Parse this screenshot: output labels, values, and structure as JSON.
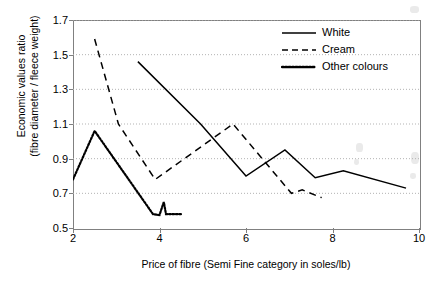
{
  "chart_data": {
    "type": "line",
    "title": "",
    "subtitle": "",
    "xlabel": "Price of fibre (Semi Fine category in soles/lb)",
    "ylabel_line1": "Economic values ratio",
    "ylabel_line2": "(fibre diameter / fleece weight)",
    "xlim": [
      2,
      10
    ],
    "ylim": [
      0.5,
      1.7
    ],
    "xticks": [
      2,
      4,
      6,
      8,
      10
    ],
    "xtick_labels": [
      "2",
      "4",
      "6",
      "8",
      "10"
    ],
    "yticks": [
      0.5,
      0.7,
      0.9,
      1.1,
      1.3,
      1.5,
      1.7
    ],
    "ytick_labels": [
      "0.5",
      "0.7",
      "0.9",
      "1.1",
      "1.3",
      "1.5",
      "1.7"
    ],
    "grid": "horizontal-dotted",
    "legend_position": "top-right",
    "legend_entries": [
      "White",
      "Cream",
      "Other colours"
    ],
    "series": [
      {
        "name": "White",
        "style": "solid",
        "color": "#000000",
        "points": [
          [
            3.5,
            1.46
          ],
          [
            4.95,
            1.1
          ],
          [
            6.0,
            0.8
          ],
          [
            6.9,
            0.95
          ],
          [
            7.6,
            0.79
          ],
          [
            8.25,
            0.83
          ],
          [
            9.7,
            0.73
          ]
        ]
      },
      {
        "name": "Cream",
        "style": "dashed",
        "color": "#000000",
        "points": [
          [
            2.5,
            1.59
          ],
          [
            3.05,
            1.1
          ],
          [
            3.9,
            0.78
          ],
          [
            5.7,
            1.1
          ],
          [
            7.05,
            0.7
          ],
          [
            7.3,
            0.72
          ],
          [
            7.75,
            0.675
          ]
        ]
      },
      {
        "name": "Other colours",
        "style": "dotted",
        "color": "#000000",
        "points": [
          [
            2.0,
            0.78
          ],
          [
            2.5,
            1.06
          ],
          [
            3.85,
            0.58
          ],
          [
            4.0,
            0.575
          ],
          [
            4.1,
            0.65
          ],
          [
            4.15,
            0.58
          ],
          [
            4.5,
            0.58
          ]
        ]
      }
    ]
  },
  "axes": {
    "x_title": "Price of fibre (Semi Fine category in soles/lb)",
    "y_title_line1": "Economic values ratio",
    "y_title_line2": "(fibre diameter / fleece weight)"
  },
  "legend": {
    "items": [
      {
        "label": "White",
        "style": "solid"
      },
      {
        "label": "Cream",
        "style": "dashed"
      },
      {
        "label": "Other colours",
        "style": "dotted"
      }
    ]
  },
  "colors": {
    "line": "#000000",
    "frame": "#808080",
    "grid": "#b3b3b3",
    "background": "#ffffff"
  }
}
